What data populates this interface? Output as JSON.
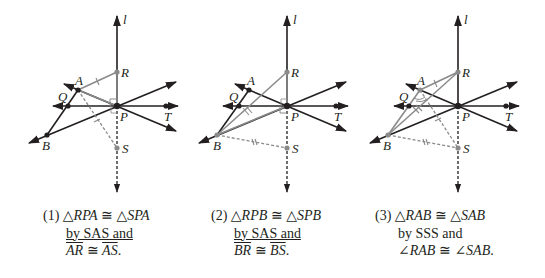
{
  "panels": [
    {
      "id": 1,
      "points": {
        "l": "l",
        "R": "R",
        "A": "A",
        "Q": "Q",
        "P": "P",
        "T": "T",
        "B": "B",
        "S": "S"
      },
      "caption": {
        "number": "(1)",
        "line1_tri1": "△RPA",
        "line1_cong": "≅",
        "line1_tri2": "△SPA",
        "line2": "by SAS and",
        "line3_seg1": "AR",
        "line3_cong": "≅",
        "line3_seg2": "AS",
        "line3_end": "."
      }
    },
    {
      "id": 2,
      "points": {
        "l": "l",
        "R": "R",
        "A": "A",
        "Q": "Q",
        "P": "P",
        "T": "T",
        "B": "B",
        "S": "S"
      },
      "caption": {
        "number": "(2)",
        "line1_tri1": "△RPB",
        "line1_cong": "≅",
        "line1_tri2": "△SPB",
        "line2": "by SAS and",
        "line3_seg1": "BR",
        "line3_cong": "≅",
        "line3_seg2": "BS",
        "line3_end": "."
      }
    },
    {
      "id": 3,
      "points": {
        "l": "l",
        "R": "R",
        "A": "A",
        "Q": "Q",
        "P": "P",
        "T": "T",
        "B": "B",
        "S": "S"
      },
      "caption": {
        "number": "(3)",
        "line1_tri1": "△RAB",
        "line1_cong": "≅",
        "line1_tri2": "△SAB",
        "line2": "by SSS and",
        "line3_ang1": "∠RAB",
        "line3_cong": "≅",
        "line3_ang2": "∠SAB",
        "line3_end": "."
      }
    }
  ],
  "colors": {
    "ink": "#231f20",
    "gray": "#8a8a8a"
  }
}
